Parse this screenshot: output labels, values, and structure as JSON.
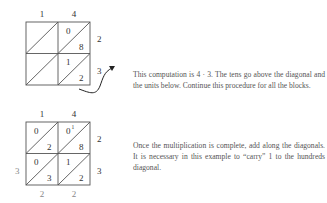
{
  "figure1": {
    "top_labels": [
      "1",
      "4"
    ],
    "right_labels": [
      "2",
      "3"
    ],
    "cells": [
      {
        "row": 0,
        "col": 0,
        "tens": "",
        "units": ""
      },
      {
        "row": 0,
        "col": 1,
        "tens": "0",
        "units": "8"
      },
      {
        "row": 1,
        "col": 0,
        "tens": "",
        "units": ""
      },
      {
        "row": 1,
        "col": 1,
        "tens": "1",
        "units": "2"
      }
    ],
    "caption": "This computation is 4 · 3. The tens go above the diagonal and the units below. Continue this procedure for all the blocks."
  },
  "figure2": {
    "top_labels": [
      "1",
      "4"
    ],
    "right_labels": [
      "2",
      "3"
    ],
    "left_labels": [
      "",
      "3"
    ],
    "bottom_labels": [
      "2",
      "2"
    ],
    "cells": [
      {
        "row": 0,
        "col": 0,
        "tens": "0",
        "units": "2"
      },
      {
        "row": 0,
        "col": 1,
        "tens": "0",
        "units": "8",
        "carry": "1"
      },
      {
        "row": 1,
        "col": 0,
        "tens": "0",
        "units": "3"
      },
      {
        "row": 1,
        "col": 1,
        "tens": "1",
        "units": "2"
      }
    ],
    "caption": "Once the multiplication is complete, add along the diagonals. It is necessary in this example to “carry” 1 to the hundreds diagonal."
  },
  "colors": {
    "grid_line": "#555555",
    "text": "#333333",
    "caption_text": "#555555",
    "result_digits": "#888888"
  }
}
